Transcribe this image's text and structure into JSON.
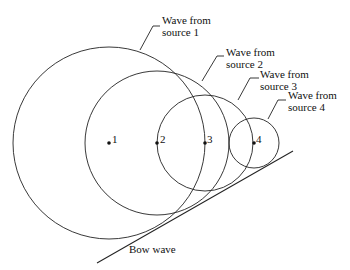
{
  "diagram": {
    "sources": [
      {
        "id": "1",
        "label_line1": "Wave from",
        "label_line2": "source 1",
        "cx": 109,
        "cy": 143,
        "r": 96
      },
      {
        "id": "2",
        "label_line1": "Wave from",
        "label_line2": "source 2",
        "cx": 157,
        "cy": 143,
        "r": 72
      },
      {
        "id": "3",
        "label_line1": "Wave from",
        "label_line2": "source 3",
        "cx": 205,
        "cy": 143,
        "r": 48
      },
      {
        "id": "4",
        "label_line1": "Wave from",
        "label_line2": "source 4",
        "cx": 254,
        "cy": 143,
        "r": 25
      }
    ],
    "bow_wave_label": "Bow wave",
    "line_color": "#222222",
    "background": "#ffffff"
  }
}
